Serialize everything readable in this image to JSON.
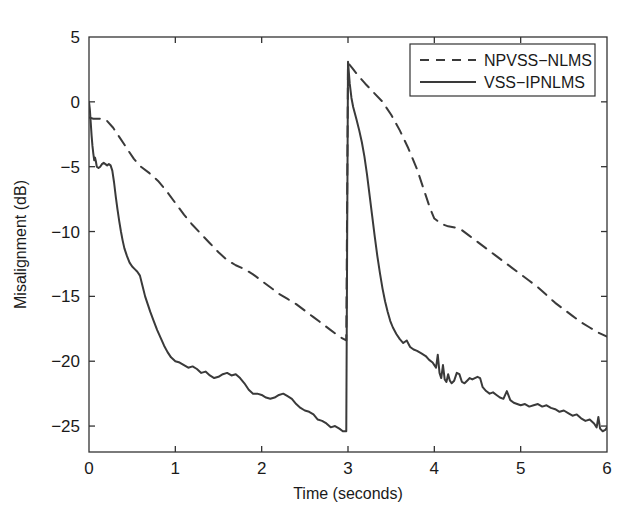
{
  "chart_data": {
    "type": "line",
    "title": "",
    "xlabel": "Time (seconds)",
    "ylabel": "Misalignment (dB)",
    "xlim": [
      0,
      6
    ],
    "ylim": [
      -27,
      5
    ],
    "xticks": [
      0,
      1,
      2,
      3,
      4,
      5,
      6
    ],
    "xticklabels": [
      "0",
      "1",
      "2",
      "3",
      "4",
      "5",
      "6"
    ],
    "yticks": [
      5,
      0,
      -5,
      -10,
      -15,
      -20,
      -25
    ],
    "yticklabels": [
      "5",
      "0",
      "−5",
      "−10",
      "−15",
      "−20",
      "−25"
    ],
    "grid": false,
    "legend_position": "upper right",
    "note": "Echo path change at t = 3 s causes both curves to jump to about +3 dB",
    "series": [
      {
        "name": "NPVSS−NLMS",
        "style": "dashed",
        "color": "#3a3a3a",
        "points": [
          [
            0.0,
            -1.2
          ],
          [
            0.05,
            -1.3
          ],
          [
            0.12,
            -1.3
          ],
          [
            0.2,
            -1.4
          ],
          [
            0.28,
            -2.0
          ],
          [
            0.36,
            -2.8
          ],
          [
            0.44,
            -3.6
          ],
          [
            0.52,
            -4.4
          ],
          [
            0.6,
            -5.0
          ],
          [
            0.7,
            -5.5
          ],
          [
            0.8,
            -6.1
          ],
          [
            0.9,
            -6.9
          ],
          [
            1.0,
            -7.8
          ],
          [
            1.1,
            -8.7
          ],
          [
            1.2,
            -9.5
          ],
          [
            1.3,
            -10.2
          ],
          [
            1.4,
            -10.9
          ],
          [
            1.5,
            -11.6
          ],
          [
            1.6,
            -12.2
          ],
          [
            1.7,
            -12.6
          ],
          [
            1.8,
            -12.9
          ],
          [
            1.9,
            -13.3
          ],
          [
            2.0,
            -13.8
          ],
          [
            2.1,
            -14.3
          ],
          [
            2.2,
            -14.8
          ],
          [
            2.3,
            -15.2
          ],
          [
            2.4,
            -15.6
          ],
          [
            2.5,
            -16.1
          ],
          [
            2.6,
            -16.6
          ],
          [
            2.7,
            -17.1
          ],
          [
            2.8,
            -17.6
          ],
          [
            2.9,
            -18.1
          ],
          [
            2.98,
            -18.4
          ],
          [
            3.0,
            3.0
          ],
          [
            3.05,
            2.6
          ],
          [
            3.12,
            2.0
          ],
          [
            3.2,
            1.4
          ],
          [
            3.3,
            0.7
          ],
          [
            3.4,
            0.0
          ],
          [
            3.5,
            -1.0
          ],
          [
            3.6,
            -2.2
          ],
          [
            3.7,
            -3.6
          ],
          [
            3.8,
            -5.2
          ],
          [
            3.88,
            -6.8
          ],
          [
            3.95,
            -8.2
          ],
          [
            4.0,
            -9.0
          ],
          [
            4.08,
            -9.4
          ],
          [
            4.16,
            -9.6
          ],
          [
            4.24,
            -9.7
          ],
          [
            4.32,
            -9.9
          ],
          [
            4.4,
            -10.3
          ],
          [
            4.5,
            -10.8
          ],
          [
            4.6,
            -11.3
          ],
          [
            4.7,
            -11.8
          ],
          [
            4.8,
            -12.3
          ],
          [
            4.9,
            -12.8
          ],
          [
            5.0,
            -13.3
          ],
          [
            5.1,
            -13.8
          ],
          [
            5.2,
            -14.3
          ],
          [
            5.3,
            -14.9
          ],
          [
            5.4,
            -15.5
          ],
          [
            5.5,
            -16.0
          ],
          [
            5.6,
            -16.5
          ],
          [
            5.7,
            -17.0
          ],
          [
            5.8,
            -17.4
          ],
          [
            5.9,
            -17.8
          ],
          [
            6.0,
            -18.1
          ]
        ]
      },
      {
        "name": "VSS−IPNLMS",
        "style": "solid",
        "color": "#3a3a3a",
        "points": [
          [
            0.0,
            0.0
          ],
          [
            0.01,
            -0.6
          ],
          [
            0.02,
            -1.6
          ],
          [
            0.03,
            -2.6
          ],
          [
            0.04,
            -3.4
          ],
          [
            0.05,
            -4.0
          ],
          [
            0.06,
            -4.5
          ],
          [
            0.07,
            -4.3
          ],
          [
            0.08,
            -4.6
          ],
          [
            0.09,
            -5.0
          ],
          [
            0.11,
            -5.1
          ],
          [
            0.13,
            -5.0
          ],
          [
            0.15,
            -4.8
          ],
          [
            0.17,
            -4.7
          ],
          [
            0.19,
            -4.8
          ],
          [
            0.21,
            -4.9
          ],
          [
            0.23,
            -4.8
          ],
          [
            0.25,
            -4.9
          ],
          [
            0.27,
            -5.3
          ],
          [
            0.29,
            -6.2
          ],
          [
            0.31,
            -7.3
          ],
          [
            0.33,
            -8.3
          ],
          [
            0.35,
            -9.2
          ],
          [
            0.37,
            -10.0
          ],
          [
            0.39,
            -10.7
          ],
          [
            0.41,
            -11.3
          ],
          [
            0.44,
            -11.9
          ],
          [
            0.47,
            -12.4
          ],
          [
            0.5,
            -12.7
          ],
          [
            0.53,
            -12.9
          ],
          [
            0.56,
            -13.1
          ],
          [
            0.59,
            -13.4
          ],
          [
            0.62,
            -14.2
          ],
          [
            0.65,
            -15.0
          ],
          [
            0.68,
            -15.6
          ],
          [
            0.71,
            -16.2
          ],
          [
            0.75,
            -16.9
          ],
          [
            0.79,
            -17.6
          ],
          [
            0.83,
            -18.2
          ],
          [
            0.87,
            -18.8
          ],
          [
            0.91,
            -19.3
          ],
          [
            0.95,
            -19.7
          ],
          [
            1.0,
            -20.0
          ],
          [
            1.05,
            -20.1
          ],
          [
            1.1,
            -20.3
          ],
          [
            1.15,
            -20.5
          ],
          [
            1.2,
            -20.4
          ],
          [
            1.25,
            -20.6
          ],
          [
            1.3,
            -20.9
          ],
          [
            1.35,
            -20.8
          ],
          [
            1.4,
            -21.1
          ],
          [
            1.45,
            -21.3
          ],
          [
            1.5,
            -21.2
          ],
          [
            1.55,
            -21.0
          ],
          [
            1.6,
            -20.9
          ],
          [
            1.65,
            -21.1
          ],
          [
            1.7,
            -21.0
          ],
          [
            1.75,
            -21.3
          ],
          [
            1.8,
            -21.7
          ],
          [
            1.85,
            -22.2
          ],
          [
            1.9,
            -22.5
          ],
          [
            1.95,
            -22.5
          ],
          [
            2.0,
            -22.6
          ],
          [
            2.05,
            -22.8
          ],
          [
            2.1,
            -22.9
          ],
          [
            2.15,
            -22.8
          ],
          [
            2.2,
            -22.6
          ],
          [
            2.25,
            -22.5
          ],
          [
            2.3,
            -22.7
          ],
          [
            2.35,
            -22.9
          ],
          [
            2.4,
            -23.3
          ],
          [
            2.45,
            -23.6
          ],
          [
            2.5,
            -23.8
          ],
          [
            2.55,
            -23.9
          ],
          [
            2.6,
            -24.1
          ],
          [
            2.65,
            -24.5
          ],
          [
            2.7,
            -24.6
          ],
          [
            2.75,
            -24.8
          ],
          [
            2.8,
            -25.1
          ],
          [
            2.85,
            -25.0
          ],
          [
            2.9,
            -25.2
          ],
          [
            2.94,
            -25.4
          ],
          [
            2.98,
            -25.4
          ],
          [
            3.0,
            3.1
          ],
          [
            3.02,
            1.4
          ],
          [
            3.04,
            0.3
          ],
          [
            3.06,
            -0.4
          ],
          [
            3.08,
            -0.9
          ],
          [
            3.1,
            -1.4
          ],
          [
            3.13,
            -2.2
          ],
          [
            3.16,
            -3.1
          ],
          [
            3.19,
            -4.2
          ],
          [
            3.22,
            -5.6
          ],
          [
            3.25,
            -7.2
          ],
          [
            3.28,
            -8.8
          ],
          [
            3.31,
            -10.4
          ],
          [
            3.34,
            -11.9
          ],
          [
            3.37,
            -13.2
          ],
          [
            3.4,
            -14.4
          ],
          [
            3.43,
            -15.4
          ],
          [
            3.46,
            -16.2
          ],
          [
            3.49,
            -16.9
          ],
          [
            3.52,
            -17.4
          ],
          [
            3.56,
            -17.9
          ],
          [
            3.6,
            -18.3
          ],
          [
            3.64,
            -18.6
          ],
          [
            3.68,
            -18.4
          ],
          [
            3.72,
            -18.9
          ],
          [
            3.76,
            -19.1
          ],
          [
            3.8,
            -19.2
          ],
          [
            3.85,
            -19.4
          ],
          [
            3.9,
            -19.6
          ],
          [
            3.94,
            -19.9
          ],
          [
            3.98,
            -20.1
          ],
          [
            4.0,
            -20.3
          ],
          [
            4.02,
            -20.5
          ],
          [
            4.04,
            -19.5
          ],
          [
            4.06,
            -20.9
          ],
          [
            4.08,
            -21.3
          ],
          [
            4.1,
            -20.3
          ],
          [
            4.12,
            -21.4
          ],
          [
            4.14,
            -21.6
          ],
          [
            4.16,
            -21.0
          ],
          [
            4.18,
            -21.5
          ],
          [
            4.2,
            -21.7
          ],
          [
            4.23,
            -21.5
          ],
          [
            4.26,
            -20.9
          ],
          [
            4.29,
            -21.0
          ],
          [
            4.32,
            -21.6
          ],
          [
            4.35,
            -21.7
          ],
          [
            4.38,
            -21.5
          ],
          [
            4.41,
            -21.3
          ],
          [
            4.44,
            -21.4
          ],
          [
            4.47,
            -21.3
          ],
          [
            4.5,
            -21.2
          ],
          [
            4.53,
            -21.3
          ],
          [
            4.56,
            -22.0
          ],
          [
            4.6,
            -22.3
          ],
          [
            4.64,
            -22.5
          ],
          [
            4.68,
            -22.4
          ],
          [
            4.72,
            -22.6
          ],
          [
            4.76,
            -22.8
          ],
          [
            4.8,
            -22.9
          ],
          [
            4.84,
            -22.3
          ],
          [
            4.88,
            -23.0
          ],
          [
            4.92,
            -23.2
          ],
          [
            4.96,
            -23.3
          ],
          [
            5.0,
            -23.4
          ],
          [
            5.05,
            -23.3
          ],
          [
            5.1,
            -23.5
          ],
          [
            5.15,
            -23.4
          ],
          [
            5.2,
            -23.3
          ],
          [
            5.25,
            -23.5
          ],
          [
            5.3,
            -23.4
          ],
          [
            5.35,
            -23.6
          ],
          [
            5.4,
            -23.7
          ],
          [
            5.45,
            -23.9
          ],
          [
            5.5,
            -23.8
          ],
          [
            5.55,
            -24.0
          ],
          [
            5.6,
            -24.2
          ],
          [
            5.65,
            -24.1
          ],
          [
            5.7,
            -24.4
          ],
          [
            5.75,
            -24.6
          ],
          [
            5.8,
            -24.5
          ],
          [
            5.85,
            -24.8
          ],
          [
            5.88,
            -25.1
          ],
          [
            5.9,
            -24.3
          ],
          [
            5.92,
            -25.2
          ],
          [
            5.95,
            -25.4
          ],
          [
            5.98,
            -25.3
          ],
          [
            6.0,
            -25.1
          ]
        ]
      }
    ],
    "legend": [
      {
        "label": "NPVSS−NLMS",
        "style": "dashed"
      },
      {
        "label": "VSS−IPNLMS",
        "style": "solid"
      }
    ]
  },
  "figure": {
    "background": "#ffffff",
    "line_color": "#3a3a3a",
    "axis_color": "#333333"
  }
}
